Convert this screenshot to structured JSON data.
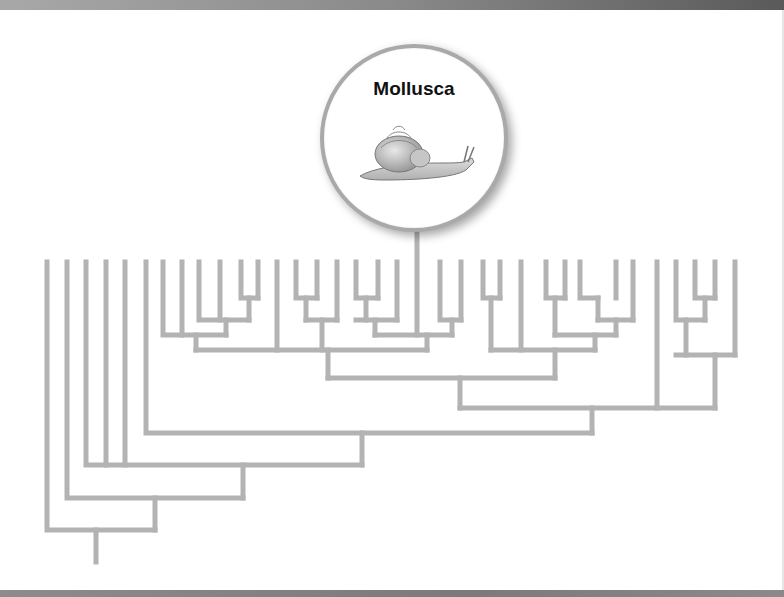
{
  "figure": {
    "type": "phylogenetic-tree",
    "line_color": "#b3b3b3",
    "highlight": {
      "label": "Mollusca",
      "icon": "snail-icon"
    },
    "leaf_count": 36
  }
}
